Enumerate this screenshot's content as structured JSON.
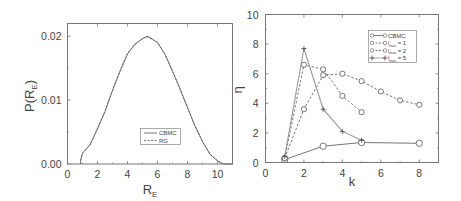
{
  "chart_data": [
    {
      "id": "left",
      "type": "line",
      "title": "",
      "xlabel": "R_E",
      "ylabel": "P(R_E)",
      "xlim": [
        0,
        11
      ],
      "ylim": [
        0,
        0.022
      ],
      "xticks": [
        0,
        2,
        4,
        6,
        8,
        10
      ],
      "xtick_labels": [
        "0",
        "2",
        "4",
        "6",
        "8",
        "10"
      ],
      "yticks": [
        0,
        0.01,
        0.02
      ],
      "ytick_labels": [
        "0.00",
        "0.01",
        "0.02"
      ],
      "grid": false,
      "legend": {
        "position": "lower-center",
        "entries": [
          "CBMC",
          "RG"
        ]
      },
      "series": [
        {
          "name": "CBMC",
          "style": "solid",
          "x": [
            0.85,
            0.9,
            1.0,
            1.2,
            1.5,
            1.8,
            2.0,
            2.5,
            3.0,
            3.5,
            4.0,
            4.5,
            5.0,
            5.3,
            5.5,
            6.0,
            6.5,
            7.0,
            7.5,
            8.0,
            8.5,
            9.0,
            9.5,
            10.0,
            10.3,
            10.6,
            11.0
          ],
          "y": [
            0.0,
            0.0008,
            0.0017,
            0.0022,
            0.003,
            0.0045,
            0.0055,
            0.0082,
            0.0115,
            0.0145,
            0.0172,
            0.0188,
            0.0196,
            0.02,
            0.0198,
            0.019,
            0.0172,
            0.0145,
            0.0118,
            0.0088,
            0.006,
            0.0035,
            0.0015,
            0.0005,
            0.0001,
            0.0,
            0.0
          ]
        },
        {
          "name": "RG",
          "style": "dashed",
          "x": [
            0.85,
            0.9,
            1.0,
            1.2,
            1.5,
            1.8,
            2.0,
            2.5,
            3.0,
            3.5,
            4.0,
            4.5,
            5.0,
            5.3,
            5.5,
            6.0,
            6.5,
            7.0,
            7.5,
            8.0,
            8.5,
            9.0,
            9.5,
            10.0,
            10.3,
            10.6,
            11.0
          ],
          "y": [
            0.0,
            0.0008,
            0.0017,
            0.0022,
            0.003,
            0.0045,
            0.0056,
            0.0083,
            0.0116,
            0.0146,
            0.0174,
            0.0187,
            0.0197,
            0.0199,
            0.0197,
            0.0191,
            0.0171,
            0.0146,
            0.0117,
            0.0089,
            0.0059,
            0.0035,
            0.0016,
            0.0005,
            0.0001,
            0.0,
            0.0
          ]
        }
      ]
    },
    {
      "id": "right",
      "type": "line",
      "title": "",
      "xlabel": "k",
      "ylabel": "η",
      "xlim": [
        0,
        9
      ],
      "ylim": [
        0,
        10
      ],
      "xticks": [
        0,
        2,
        4,
        6,
        8
      ],
      "xtick_labels": [
        "0",
        "2",
        "4",
        "6",
        "8"
      ],
      "yticks": [
        0,
        2,
        4,
        6,
        8,
        10
      ],
      "ytick_labels": [
        "0",
        "2",
        "4",
        "6",
        "8",
        "10"
      ],
      "grid": false,
      "legend": {
        "position": "upper-right",
        "entries": [
          "CBMC",
          "l_max = 1",
          "l_max = 2",
          "l_max = 5"
        ]
      },
      "series": [
        {
          "name": "CBMC",
          "label_main": "CBMC",
          "label_sub": "",
          "label_suffix": "",
          "style": "solid",
          "marker": "circle",
          "color": "#555555",
          "x": [
            1,
            3,
            5,
            8
          ],
          "y": [
            0.2,
            1.1,
            1.35,
            1.3
          ]
        },
        {
          "name": "l_max = 1",
          "label_main": "l",
          "label_sub": "max",
          "label_suffix": " = 1",
          "style": "dashed",
          "marker": "diamond",
          "color": "#555555",
          "x": [
            1,
            2,
            3,
            4,
            5,
            6,
            7,
            8
          ],
          "y": [
            0.3,
            3.6,
            5.9,
            6.0,
            5.5,
            4.8,
            4.2,
            3.9
          ]
        },
        {
          "name": "l_max = 2",
          "label_main": "l",
          "label_sub": "max",
          "label_suffix": " = 2",
          "style": "dashed",
          "marker": "diamond",
          "color": "#555555",
          "x": [
            1,
            2,
            3,
            4,
            5
          ],
          "y": [
            0.3,
            6.6,
            6.3,
            4.5,
            3.4
          ]
        },
        {
          "name": "l_max = 5",
          "label_main": "l",
          "label_sub": "max",
          "label_suffix": " = 5",
          "style": "solid",
          "marker": "plus",
          "color": "#999999",
          "x": [
            1,
            2,
            3,
            4,
            5
          ],
          "y": [
            0.4,
            7.7,
            3.6,
            2.1,
            1.5
          ]
        }
      ]
    }
  ]
}
